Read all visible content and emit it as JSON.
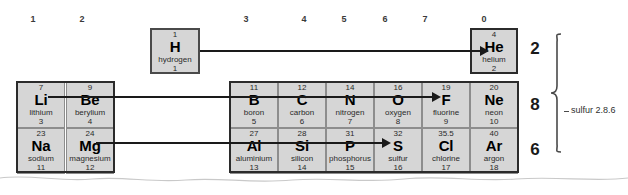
{
  "groups": {
    "label_prefix": "group",
    "headers": [
      {
        "label": "1",
        "x": 33
      },
      {
        "label": "2",
        "x": 82
      },
      {
        "label": "3",
        "x": 246
      },
      {
        "label": "4",
        "x": 304
      },
      {
        "label": "5",
        "x": 344
      },
      {
        "label": "6",
        "x": 385
      },
      {
        "label": "7",
        "x": 425
      },
      {
        "label": "0",
        "x": 484
      }
    ]
  },
  "hydrogen": {
    "mass": "1",
    "symbol": "H",
    "name": "hydrogen",
    "number": "1"
  },
  "helium": {
    "mass": "4",
    "symbol": "He",
    "name": "helium",
    "number": "2"
  },
  "period2": [
    {
      "mass": "7",
      "symbol": "Li",
      "name": "lithium",
      "number": "3",
      "x": 17,
      "group": "1"
    },
    {
      "mass": "9",
      "symbol": "Be",
      "name": "berylium",
      "number": "4",
      "x": 66,
      "group": "2"
    },
    {
      "mass": "11",
      "symbol": "B",
      "name": "boron",
      "number": "5",
      "x": 230,
      "group": "3"
    },
    {
      "mass": "12",
      "symbol": "C",
      "name": "carbon",
      "number": "6",
      "x": 278,
      "group": "4"
    },
    {
      "mass": "14",
      "symbol": "N",
      "name": "nitrogen",
      "number": "7",
      "x": 326,
      "group": "5"
    },
    {
      "mass": "16",
      "symbol": "O",
      "name": "oxygen",
      "number": "8",
      "x": 374,
      "group": "6"
    },
    {
      "mass": "19",
      "symbol": "F",
      "name": "fluorine",
      "number": "9",
      "x": 422,
      "group": "7"
    },
    {
      "mass": "20",
      "symbol": "Ne",
      "name": "neon",
      "number": "10",
      "x": 470,
      "group": "0"
    }
  ],
  "period3": [
    {
      "mass": "23",
      "symbol": "Na",
      "name": "sodium",
      "number": "11",
      "x": 17,
      "group": "1"
    },
    {
      "mass": "24",
      "symbol": "Mg",
      "name": "magnesium",
      "number": "12",
      "x": 66,
      "group": "2"
    },
    {
      "mass": "27",
      "symbol": "Al",
      "name": "aluminium",
      "number": "13",
      "x": 230,
      "group": "3"
    },
    {
      "mass": "28",
      "symbol": "Si",
      "name": "silicon",
      "number": "14",
      "x": 278,
      "group": "4"
    },
    {
      "mass": "31",
      "symbol": "P",
      "name": "phosphorus",
      "number": "15",
      "x": 326,
      "group": "5"
    },
    {
      "mass": "32",
      "symbol": "S",
      "name": "sulfur",
      "number": "16",
      "x": 374,
      "group": "6"
    },
    {
      "mass": "35.5",
      "symbol": "Cl",
      "name": "chlorine",
      "number": "17",
      "x": 422,
      "group": "7"
    },
    {
      "mass": "40",
      "symbol": "Ar",
      "name": "argon",
      "number": "18",
      "x": 470,
      "group": "0"
    }
  ],
  "shell_counts": [
    {
      "value": "2",
      "y": 39
    },
    {
      "value": "8",
      "y": 95
    },
    {
      "value": "6",
      "y": 140
    }
  ],
  "annotation": {
    "text": "sulfur 2.8.6"
  },
  "arrows": [
    {
      "name": "hydrogen-to-helium",
      "from": "H",
      "to": "He"
    },
    {
      "name": "beryllium-to-neon",
      "from": "Be",
      "to": "Ne"
    },
    {
      "name": "magnesium-to-sulfur",
      "from": "Mg",
      "to": "S"
    }
  ],
  "colors": {
    "cell_fill": "#d6d6d6",
    "cell_border": "#8d8d8d",
    "frame": "#2b2b2b",
    "arrow": "#1a1a1a",
    "text": "#1a1a1a"
  }
}
